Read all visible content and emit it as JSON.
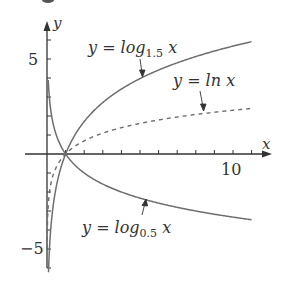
{
  "chart_data": {
    "type": "line",
    "title": "",
    "xlabel": "x",
    "ylabel": "y",
    "xlim": [
      0,
      12
    ],
    "ylim": [
      -6.3,
      7
    ],
    "x_ticks": [
      1,
      2,
      3,
      4,
      5,
      6,
      7,
      8,
      9,
      10,
      11
    ],
    "x_tick_labels_shown": {
      "10": "10"
    },
    "y_ticks": [
      -6,
      -5,
      -4,
      -3,
      -2,
      -1,
      1,
      2,
      3,
      4,
      5,
      6
    ],
    "y_tick_labels_shown": {
      "5": "5",
      "-5": "-5"
    },
    "grid": false,
    "legend": "inline annotations with arrows",
    "series": [
      {
        "name": "y = log_1.5 x",
        "base": 1.5,
        "style": "solid",
        "x_range": [
          0.08,
          11
        ],
        "samples": [
          [
            0.1,
            -5.68
          ],
          [
            0.5,
            -1.71
          ],
          [
            1,
            0
          ],
          [
            2,
            1.71
          ],
          [
            4,
            3.42
          ],
          [
            6,
            4.42
          ],
          [
            8,
            5.13
          ],
          [
            10,
            5.68
          ],
          [
            11,
            5.91
          ]
        ]
      },
      {
        "name": "y = ln x",
        "base": 2.718281828,
        "style": "dashed",
        "x_range": [
          0.0067,
          11
        ],
        "samples": [
          [
            0.01,
            -4.61
          ],
          [
            0.5,
            -0.69
          ],
          [
            1,
            0
          ],
          [
            2,
            0.69
          ],
          [
            4,
            1.39
          ],
          [
            6,
            1.79
          ],
          [
            8,
            2.08
          ],
          [
            10,
            2.3
          ],
          [
            11,
            2.4
          ]
        ]
      },
      {
        "name": "y = log_0.5 x",
        "base": 0.5,
        "style": "solid",
        "x_range": [
          0.067,
          11
        ],
        "samples": [
          [
            0.1,
            3.32
          ],
          [
            0.5,
            1
          ],
          [
            1,
            0
          ],
          [
            2,
            -1
          ],
          [
            4,
            -2
          ],
          [
            6,
            -2.58
          ],
          [
            8,
            -3
          ],
          [
            10,
            -3.32
          ],
          [
            11,
            -3.46
          ]
        ]
      }
    ],
    "annotations": [
      {
        "text": "y = log1.5 x",
        "points_to": [
          5.2,
          4.07
        ]
      },
      {
        "text": "y = ln x",
        "points_to": [
          8,
          2.08
        ]
      },
      {
        "text": "y = log0.5 x",
        "points_to": [
          6.4,
          -2.68
        ]
      }
    ]
  },
  "labels": {
    "y_axis": "y",
    "x_axis": "x",
    "tick_5": "5",
    "tick_neg5": "−5",
    "tick_10": "10",
    "log15_prefix": "y = log",
    "log15_sub": "1.5",
    "log15_suffix": " x",
    "ln_text": "y = ln x",
    "log05_prefix": "y = log",
    "log05_sub": "0.5",
    "log05_suffix": " x"
  },
  "colors": {
    "axis": "#333333",
    "curve": "#6e6e6e",
    "text": "#333333"
  }
}
